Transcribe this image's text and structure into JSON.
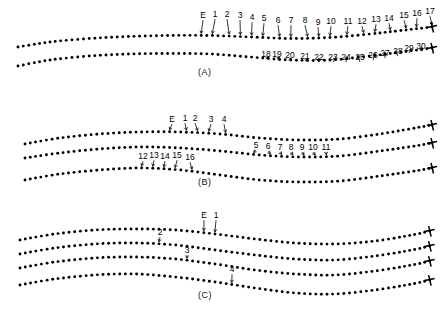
{
  "figure": {
    "type": "scientific-line-diagram",
    "background_color": "#ffffff",
    "ink_color": "#000000"
  },
  "panels": [
    {
      "id": "A",
      "caption": "(A)",
      "curve_count": 2,
      "annotations_top": [
        "E",
        "1",
        "2",
        "3",
        "4",
        "5",
        "6",
        "7",
        "8",
        "9",
        "10",
        "11",
        "12",
        "13",
        "14",
        "15",
        "16",
        "17"
      ],
      "annotations_bottom": [
        "18",
        "19",
        "20",
        "21",
        "22",
        "23",
        "24",
        "25",
        "26",
        "27",
        "28",
        "29",
        "30"
      ]
    },
    {
      "id": "B",
      "caption": "(B)",
      "curve_count": 3,
      "annotations_top": [
        "E",
        "1",
        "2",
        "3",
        "4"
      ],
      "annotations_middle": [
        "5",
        "6",
        "7",
        "8",
        "9",
        "10",
        "11"
      ],
      "annotations_lower": [
        "12",
        "13",
        "14",
        "15",
        "16"
      ]
    },
    {
      "id": "C",
      "caption": "(C)",
      "curve_count": 4,
      "annotations": [
        "E",
        "1",
        "2",
        "3",
        "4"
      ]
    }
  ],
  "chart_data": {
    "type": "line",
    "title": "",
    "xlabel": "",
    "ylabel": "",
    "grid": false,
    "legend": "none",
    "marker": "filled-circle",
    "line_style": "dotted-markers",
    "end_marker": "cross-tick",
    "panels": [
      {
        "name": "(A)",
        "series": [
          {
            "name": "A-upper",
            "x": [
              18,
              50,
              90,
              130,
              170,
              210,
              250,
              290,
              330,
              370,
              410,
              432
            ],
            "y": [
              47,
              42,
              38.5,
              36.5,
              35.5,
              35.5,
              37,
              38.5,
              37.5,
              34,
              29.5,
              27
            ]
          },
          {
            "name": "A-lower",
            "x": [
              18,
              50,
              90,
              130,
              170,
              210,
              250,
              290,
              330,
              370,
              410,
              432
            ],
            "y": [
              66,
              60,
              56,
              54,
              53.5,
              54,
              57,
              60,
              60,
              56,
              51,
              48
            ]
          }
        ],
        "labels_upper": [
          {
            "text": "E",
            "x": 203,
            "y": 18
          },
          {
            "text": "1",
            "x": 215,
            "y": 17
          },
          {
            "text": "2",
            "x": 227,
            "y": 17
          },
          {
            "text": "3",
            "x": 240,
            "y": 18
          },
          {
            "text": "4",
            "x": 252,
            "y": 20
          },
          {
            "text": "5",
            "x": 264,
            "y": 21
          },
          {
            "text": "6",
            "x": 278,
            "y": 23
          },
          {
            "text": "7",
            "x": 291,
            "y": 23
          },
          {
            "text": "8",
            "x": 305,
            "y": 23
          },
          {
            "text": "9",
            "x": 318,
            "y": 25
          },
          {
            "text": "10",
            "x": 331,
            "y": 24
          },
          {
            "text": "11",
            "x": 348,
            "y": 24
          },
          {
            "text": "12",
            "x": 362,
            "y": 24
          },
          {
            "text": "13",
            "x": 376,
            "y": 22
          },
          {
            "text": "14",
            "x": 389,
            "y": 21
          },
          {
            "text": "15",
            "x": 404,
            "y": 18
          },
          {
            "text": "16",
            "x": 417,
            "y": 16
          },
          {
            "text": "17",
            "x": 430,
            "y": 14
          }
        ],
        "labels_lower": [
          {
            "text": "18",
            "x": 266,
            "y": 57
          },
          {
            "text": "19",
            "x": 277,
            "y": 57
          },
          {
            "text": "20",
            "x": 290,
            "y": 58
          },
          {
            "text": "21",
            "x": 305,
            "y": 59
          },
          {
            "text": "22",
            "x": 319,
            "y": 60
          },
          {
            "text": "23",
            "x": 333,
            "y": 60
          },
          {
            "text": "24",
            "x": 346,
            "y": 60
          },
          {
            "text": "25",
            "x": 360,
            "y": 60
          },
          {
            "text": "26",
            "x": 373,
            "y": 58
          },
          {
            "text": "27",
            "x": 385,
            "y": 56
          },
          {
            "text": "28",
            "x": 398,
            "y": 54
          },
          {
            "text": "29",
            "x": 409,
            "y": 51
          },
          {
            "text": "30",
            "x": 421,
            "y": 49
          }
        ]
      },
      {
        "name": "(B)",
        "series": [
          {
            "name": "B-upper",
            "x": [
              25,
              60,
              100,
              140,
              180,
              220,
              260,
              300,
              340,
              380,
              415,
              432
            ],
            "y": [
              144,
              138,
              134,
              132,
              132,
              134,
              138,
              140,
              139,
              134,
              128,
              125
            ]
          },
          {
            "name": "B-middle",
            "x": [
              25,
              60,
              100,
              140,
              180,
              220,
              260,
              300,
              340,
              380,
              415,
              432
            ],
            "y": [
              158,
              153,
              149,
              147,
              148,
              151,
              155,
              157,
              156,
              151,
              146,
              143
            ]
          },
          {
            "name": "B-lower",
            "x": [
              25,
              60,
              100,
              140,
              180,
              220,
              260,
              300,
              340,
              380,
              415,
              432
            ],
            "y": [
              180,
              174,
              170,
              168,
              170,
              175,
              180,
              182,
              181,
              176,
              171,
              168
            ]
          }
        ],
        "labels_top": [
          {
            "text": "E",
            "x": 172,
            "y": 122
          },
          {
            "text": "1",
            "x": 185,
            "y": 121
          },
          {
            "text": "2",
            "x": 195,
            "y": 121
          },
          {
            "text": "3",
            "x": 211,
            "y": 122
          },
          {
            "text": "4",
            "x": 224,
            "y": 122
          }
        ],
        "labels_middle": [
          {
            "text": "5",
            "x": 256,
            "y": 148
          },
          {
            "text": "6",
            "x": 268,
            "y": 149
          },
          {
            "text": "7",
            "x": 280,
            "y": 150
          },
          {
            "text": "8",
            "x": 291,
            "y": 150
          },
          {
            "text": "9",
            "x": 302,
            "y": 150
          },
          {
            "text": "10",
            "x": 313,
            "y": 150
          },
          {
            "text": "11",
            "x": 326,
            "y": 150
          }
        ],
        "labels_lower": [
          {
            "text": "12",
            "x": 143,
            "y": 159
          },
          {
            "text": "13",
            "x": 154,
            "y": 158
          },
          {
            "text": "14",
            "x": 165,
            "y": 159
          },
          {
            "text": "15",
            "x": 177,
            "y": 158
          },
          {
            "text": "16",
            "x": 190,
            "y": 160
          }
        ]
      },
      {
        "name": "(C)",
        "series": [
          {
            "name": "C-curve-1",
            "x": [
              20,
              55,
              95,
              135,
              175,
              215,
              255,
              295,
              335,
              375,
              412,
              430
            ],
            "y": [
              240,
              234,
              230,
              229,
              230,
              234,
              239,
              243,
              244,
              241,
              235,
              231
            ]
          },
          {
            "name": "C-curve-2",
            "x": [
              20,
              55,
              95,
              135,
              175,
              215,
              255,
              295,
              335,
              375,
              412,
              430
            ],
            "y": [
              254,
              248,
              244,
              243,
              245,
              250,
              255,
              259,
              260,
              256,
              250,
              246
            ]
          },
          {
            "name": "C-curve-3",
            "x": [
              20,
              55,
              95,
              135,
              175,
              215,
              255,
              295,
              335,
              375,
              412,
              430
            ],
            "y": [
              268,
              262,
              258,
              257,
              259,
              264,
              270,
              274,
              275,
              271,
              265,
              261
            ]
          },
          {
            "name": "C-curve-4",
            "x": [
              20,
              55,
              95,
              135,
              175,
              215,
              255,
              295,
              335,
              375,
              412,
              430
            ],
            "y": [
              285,
              279,
              275,
              274,
              277,
              282,
              288,
              293,
              294,
              290,
              284,
              280
            ]
          }
        ],
        "labels": [
          {
            "text": "E",
            "x": 204,
            "y": 218
          },
          {
            "text": "1",
            "x": 216,
            "y": 218
          },
          {
            "text": "2",
            "x": 160,
            "y": 235
          },
          {
            "text": "3",
            "x": 187,
            "y": 253
          },
          {
            "text": "4",
            "x": 232,
            "y": 272
          }
        ]
      }
    ]
  }
}
